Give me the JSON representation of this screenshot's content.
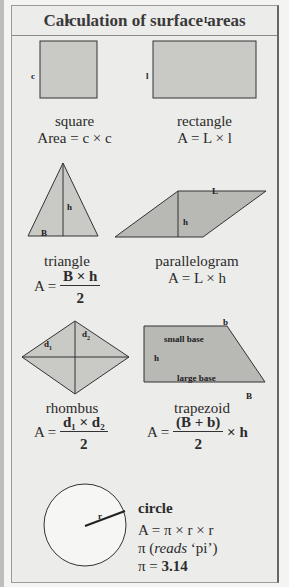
{
  "title": "Calculation of surface areas",
  "colors": {
    "shape_fill": "#c9c9c6",
    "shape_fill_dark": "#b8b8b5",
    "background": "#ececea",
    "stroke": "#333333"
  },
  "square": {
    "side_top": "c",
    "side_left": "c",
    "name": "square",
    "formula": "Area = c × c"
  },
  "rectangle": {
    "side_top": "L",
    "side_left": "l",
    "name": "rectangle",
    "formula": "A = L × l"
  },
  "triangle": {
    "height_label": "h",
    "base_label": "B",
    "name": "triangle",
    "formula_prefix": "A =",
    "numerator": "B × h",
    "denominator": "2"
  },
  "parallelogram": {
    "side_label": "L",
    "height_label": "h",
    "name": "parallelogram",
    "formula": "A = L × h"
  },
  "rhombus": {
    "d1": "d",
    "d1_sub": "1",
    "d2": "d",
    "d2_sub": "2",
    "name": "rhombus",
    "formula_prefix": "A =",
    "numerator": "d₁ × d₂",
    "denominator": "2"
  },
  "trapezoid": {
    "small_base_letter": "b",
    "small_base_label": "small base",
    "height_label": "h",
    "large_base_label": "large base",
    "large_base_letter": "B",
    "name": "trapezoid",
    "formula_prefix": "A =",
    "numerator": "(B + b)",
    "denominator": "2",
    "formula_suffix": "× h"
  },
  "circle": {
    "radius_label": "r",
    "name": "circle",
    "formula": "A = π × r × r",
    "pi_reads_prefix": "π (",
    "pi_reads_italic": "reads",
    "pi_reads_suffix": " ‘pi’)",
    "pi_value_prefix": "π = ",
    "pi_value": "3.14"
  }
}
